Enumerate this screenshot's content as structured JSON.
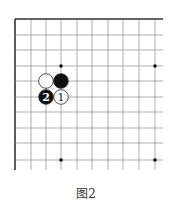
{
  "diagram": {
    "type": "go-board-corner",
    "grid": {
      "columns_x": [
        15,
        31,
        46,
        61,
        77,
        92,
        108,
        123,
        139,
        155
      ],
      "rows_y": [
        19,
        35,
        50,
        66,
        81,
        97,
        112,
        128,
        143,
        160
      ],
      "right_extent": 163,
      "bottom_extent": 170,
      "line_color": "#8a8a8a",
      "edge_color": "#333333"
    },
    "hoshi": [
      {
        "col": 3,
        "row": 3
      },
      {
        "col": 9,
        "row": 3
      },
      {
        "col": 3,
        "row": 9
      },
      {
        "col": 9,
        "row": 9
      }
    ],
    "stones": [
      {
        "color": "white",
        "col": 2,
        "row": 4,
        "label": ""
      },
      {
        "color": "black",
        "col": 3,
        "row": 4,
        "label": ""
      },
      {
        "color": "black",
        "col": 2,
        "row": 5,
        "label": "2"
      },
      {
        "color": "white",
        "col": 3,
        "row": 5,
        "label": "1"
      }
    ]
  },
  "caption": "图2"
}
